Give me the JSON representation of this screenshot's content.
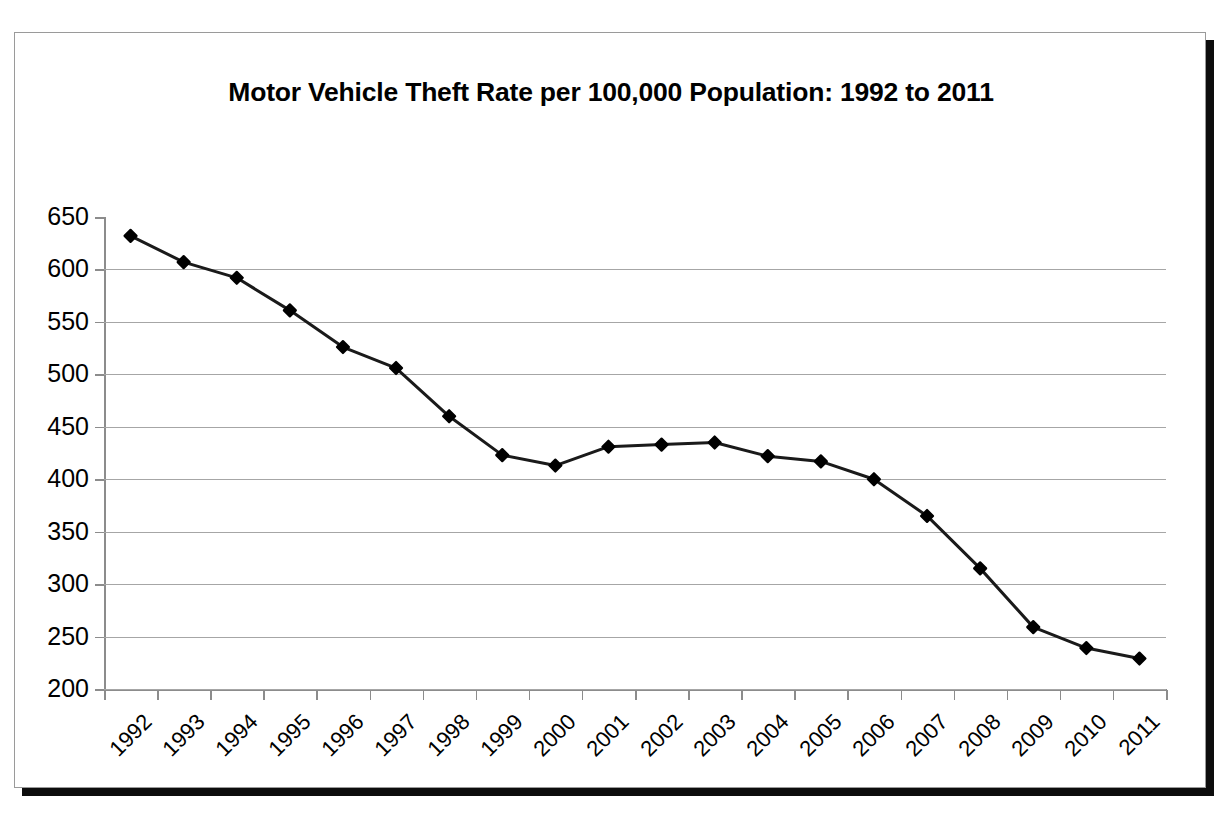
{
  "figure": {
    "title": "Motor Vehicle Theft Rate per 100,000 Population: 1992 to 2011",
    "frame_border_color": "#9a9a9a",
    "shadow_color": "#0d0d0d",
    "background_color": "#ffffff"
  },
  "chart_data": {
    "type": "line",
    "title": "Motor Vehicle Theft Rate per 100,000 Population: 1992 to 2011",
    "xlabel": "",
    "ylabel": "",
    "categories": [
      "1992",
      "1993",
      "1994",
      "1995",
      "1996",
      "1997",
      "1998",
      "1999",
      "2000",
      "2001",
      "2002",
      "2003",
      "2004",
      "2005",
      "2006",
      "2007",
      "2008",
      "2009",
      "2010",
      "2011"
    ],
    "values": [
      632,
      607,
      592,
      561,
      526,
      506,
      460,
      423,
      413,
      431,
      433,
      435,
      422,
      417,
      400,
      365,
      315,
      259,
      239,
      229
    ],
    "series": [
      {
        "name": "Motor Vehicle Theft Rate",
        "values": [
          632,
          607,
          592,
          561,
          526,
          506,
          460,
          423,
          413,
          431,
          433,
          435,
          422,
          417,
          400,
          365,
          315,
          259,
          239,
          229
        ]
      }
    ],
    "ylim": [
      200,
      650
    ],
    "ytick_labels": [
      "650",
      "600",
      "550",
      "500",
      "450",
      "400",
      "350",
      "300",
      "250",
      "200"
    ],
    "ytick_values": [
      650,
      600,
      550,
      500,
      450,
      400,
      350,
      300,
      250,
      200
    ],
    "grid": true,
    "grid_axis": "y",
    "grid_color": "#a6a6a6",
    "legend": false,
    "legend_position": "none",
    "line_color": "#1a1a1a",
    "line_width": 3,
    "marker": "diamond",
    "marker_color": "#000000",
    "marker_size": 11,
    "xtick_rotation": -45,
    "annotations": []
  }
}
